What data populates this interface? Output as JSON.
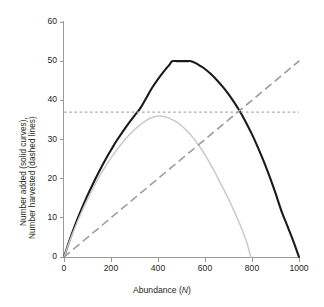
{
  "chart_data": {
    "type": "line",
    "title": "",
    "xlabel": "Abundance (N)",
    "xlabel_plain": "Abundance (",
    "xlabel_italic": "N",
    "xlabel_close": ")",
    "ylabel_line1": "Number added (solid curves),",
    "ylabel_line2": "Number harvested (dashed lines)",
    "xlim": [
      0,
      1000
    ],
    "ylim": [
      0,
      60
    ],
    "xticks": [
      0,
      200,
      400,
      600,
      800,
      1000
    ],
    "yticks": [
      0,
      10,
      20,
      30,
      40,
      50,
      60
    ],
    "xtick_labels": [
      "0",
      "200",
      "400",
      "600",
      "800",
      "1000"
    ],
    "ytick_labels": [
      "0",
      "10",
      "20",
      "30",
      "40",
      "50",
      "60"
    ],
    "grid": false,
    "legend": "none",
    "colors": {
      "recruitment_upper": "#1a1a1a",
      "recruitment_lower": "#c9c9c9",
      "harvest_proportional": "#9b9b9b",
      "harvest_fixed_quota": "#aaaaaa",
      "axis": "#9a9a9a",
      "text": "#231f20",
      "background": "#ffffff"
    },
    "series": [
      {
        "name": "Number added (upper solid curve)",
        "style": "solid",
        "color": "#1a1a1a",
        "width": 2.1,
        "peak_value": 50,
        "peak_x_range": [
          460,
          540
        ],
        "zeros": [
          0,
          1000
        ],
        "x": [
          0,
          25,
          50,
          75,
          100,
          125,
          150,
          175,
          200,
          225,
          250,
          275,
          300,
          325,
          350,
          375,
          400,
          425,
          450,
          460,
          480,
          500,
          520,
          540,
          560,
          580,
          600,
          625,
          650,
          675,
          700,
          725,
          750,
          775,
          800,
          825,
          850,
          875,
          900,
          925,
          950,
          975,
          1000
        ],
        "y": [
          0,
          4.5,
          8.6,
          12.3,
          15.7,
          18.9,
          21.9,
          24.7,
          27.3,
          29.8,
          32.0,
          34.1,
          36.1,
          38.0,
          40.6,
          43.2,
          45.4,
          47.4,
          49.2,
          50.0,
          50.0,
          50.0,
          50.0,
          50.0,
          49.5,
          48.8,
          48.0,
          46.7,
          45.2,
          43.5,
          41.6,
          39.4,
          37.0,
          34.3,
          31.3,
          28.0,
          24.4,
          20.5,
          16.3,
          11.8,
          8.0,
          4.2,
          0
        ]
      },
      {
        "name": "Number added (lower solid curve)",
        "style": "solid",
        "color": "#c9c9c9",
        "width": 1.5,
        "peak_value": 36,
        "peak_x": 400,
        "zeros": [
          0,
          795
        ],
        "x": [
          0,
          25,
          50,
          75,
          100,
          125,
          150,
          175,
          200,
          225,
          250,
          275,
          300,
          325,
          350,
          375,
          400,
          425,
          450,
          475,
          500,
          525,
          550,
          575,
          600,
          625,
          650,
          675,
          700,
          725,
          750,
          775,
          795
        ],
        "y": [
          0,
          4.2,
          8.0,
          11.5,
          14.7,
          17.7,
          20.5,
          23.0,
          25.3,
          27.4,
          29.3,
          31.0,
          32.5,
          33.8,
          34.9,
          35.6,
          36.0,
          35.9,
          35.4,
          34.6,
          33.5,
          32.1,
          30.4,
          28.4,
          26.1,
          23.5,
          20.7,
          17.8,
          14.8,
          11.6,
          8.1,
          4.2,
          0
        ]
      },
      {
        "name": "Number harvested (proportional, dashed diagonal)",
        "style": "dashed",
        "color": "#9b9b9b",
        "width": 1.6,
        "x": [
          0,
          1000
        ],
        "y": [
          0,
          50
        ],
        "slope": 0.05
      },
      {
        "name": "Number harvested (fixed quota, dashed horizontal)",
        "style": "dashed",
        "color": "#aaaaaa",
        "width": 1.1,
        "x": [
          0,
          1000
        ],
        "y": [
          37,
          37
        ],
        "constant": 37
      }
    ],
    "annotations": []
  }
}
